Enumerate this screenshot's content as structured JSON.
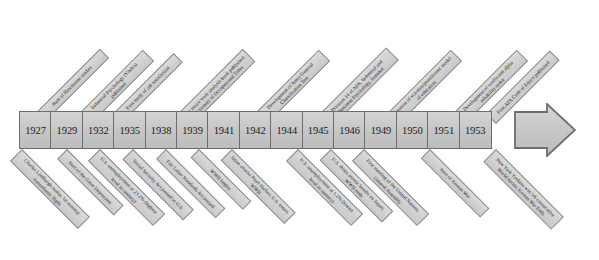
{
  "figure": {
    "colors": {
      "band_fill": "#c9c9c9",
      "band_border": "#6d6d6d",
      "tag_fill": "#cfcfcf",
      "tag_border": "#8e8e8e",
      "text": "#1c1c1c",
      "background": "#ffffff"
    }
  },
  "timeline": {
    "arrow_label": "timeline-direction-arrow",
    "entries": [
      {
        "year": "1927",
        "top_label": "Start of Hawthorne studies",
        "bottom_label": "Charles Lindbergh makes 1st nonstop transatlantic flight"
      },
      {
        "year": "1929",
        "top_label": "Industrial Psychology (Viteles) published",
        "bottom_label": "Start of the Great Depression"
      },
      {
        "year": "1932",
        "top_label": "First study of job satisfaction",
        "bottom_label": "U.S. unemployment at 23.2% (highest level in century)"
      },
      {
        "year": "1935",
        "top_label": "",
        "bottom_label": "Social Security Act passed in U.S."
      },
      {
        "year": "1938",
        "top_label": "First major work analysis book published: Dictionary of Occupational Titles",
        "bottom_label": "Fair Labor Standards Act passed"
      },
      {
        "year": "1939",
        "top_label": "",
        "bottom_label": "WWII begins"
      },
      {
        "year": "1941",
        "top_label": "",
        "bottom_label": "Japan attacks Pearl Harbor; U.S. enters WWII"
      },
      {
        "year": "1942",
        "top_label": "Development of Army General Classification Test",
        "bottom_label": ""
      },
      {
        "year": "1944",
        "top_label": "",
        "bottom_label": "U.S. unemployment at 1.2% (lowest level in century)"
      },
      {
        "year": "1945",
        "top_label": "Division 14 of APA, Industrial and Business Psychology, founded",
        "bottom_label": "U.S. drops atomic bombs on Japan; WWII ends"
      },
      {
        "year": "1946",
        "top_label": "",
        "bottom_label": "First meeting of the United Nations General Assembly"
      },
      {
        "year": "1949",
        "top_label": "Creation of scientist/practitioner model of education",
        "bottom_label": ""
      },
      {
        "year": "1950",
        "top_label": "",
        "bottom_label": "Start of Korean War"
      },
      {
        "year": "1951",
        "top_label": "Development of coefficient alpha reliability index",
        "bottom_label": ""
      },
      {
        "year": "1953",
        "top_label": "First APA Code of Ethics published",
        "bottom_label": "New York Yankees win 5th consecutive World Series; Korean War Ends"
      }
    ]
  }
}
